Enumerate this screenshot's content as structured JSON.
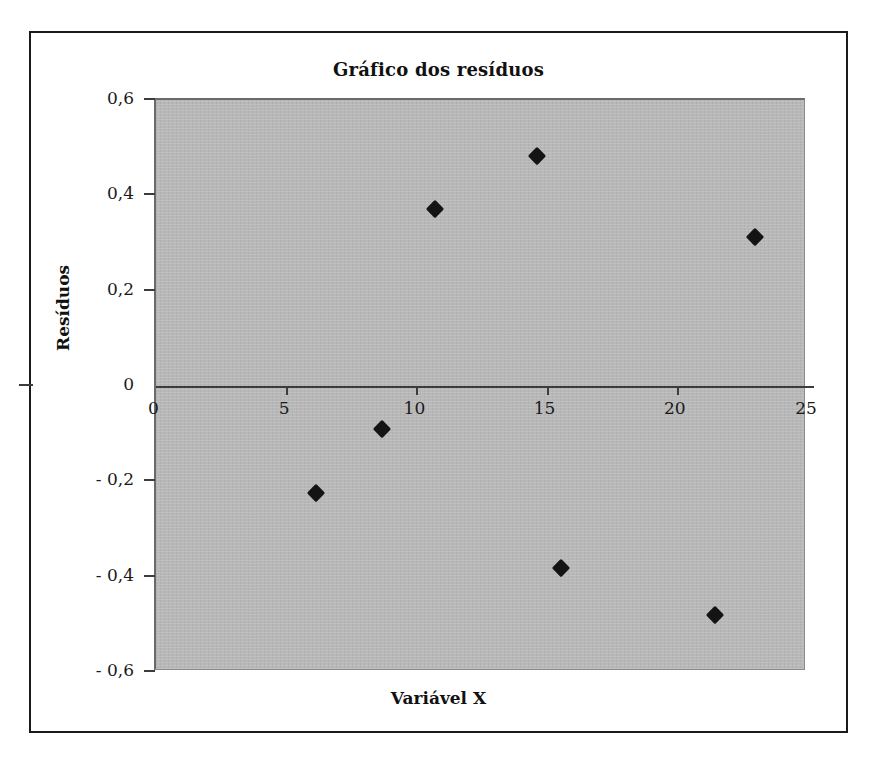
{
  "chart_data": {
    "type": "scatter",
    "title": "Gráfico dos resíduos",
    "xlabel": "Variável X",
    "ylabel": "Resíduos",
    "xlim": [
      0,
      25
    ],
    "ylim": [
      -0.6,
      0.6
    ],
    "grid": false,
    "legend": "none",
    "marker": "black-diamond",
    "plot_background": "#b8b8b8",
    "x_ticks": [
      "0",
      "5",
      "10",
      "15",
      "20",
      "25"
    ],
    "x_tick_values": [
      0,
      5,
      10,
      15,
      20,
      25
    ],
    "y_ticks": [
      "0,6",
      "0,4",
      "0,2",
      "0",
      "- 0,2",
      "- 0,4",
      "- 0,6"
    ],
    "y_tick_values": [
      0.6,
      0.4,
      0.2,
      0,
      -0.2,
      -0.4,
      -0.6
    ],
    "series": [
      {
        "name": "Resíduos",
        "points": [
          {
            "x": 6.15,
            "y": -0.225
          },
          {
            "x": 8.68,
            "y": -0.09
          },
          {
            "x": 10.7,
            "y": 0.372
          },
          {
            "x": 14.65,
            "y": 0.482
          },
          {
            "x": 15.55,
            "y": -0.382
          },
          {
            "x": 21.45,
            "y": -0.48
          },
          {
            "x": 23.0,
            "y": 0.313
          }
        ]
      }
    ]
  }
}
